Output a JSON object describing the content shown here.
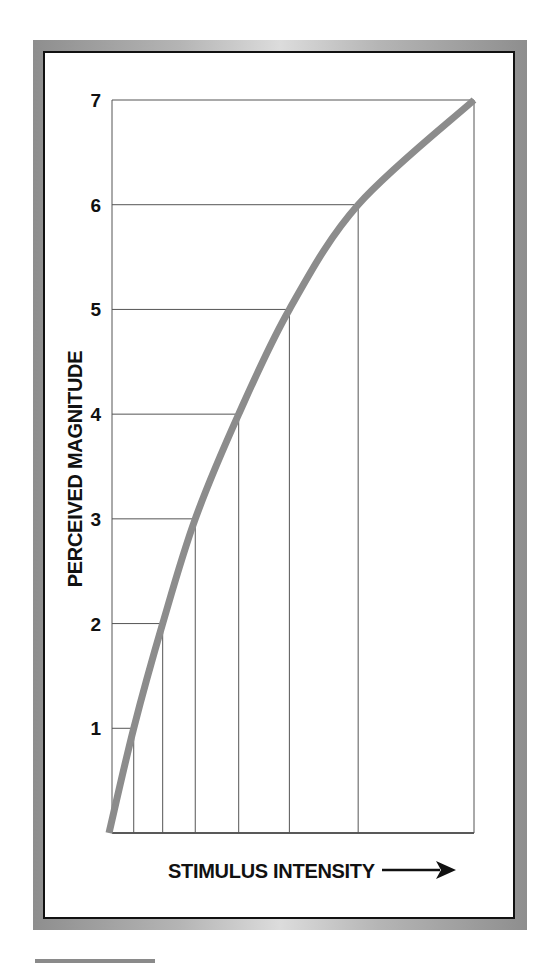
{
  "chart_data": {
    "type": "line",
    "title": "",
    "xlabel": "STIMULUS INTENSITY",
    "ylabel": "PERCEIVED MAGNITUDE",
    "x_arrow": true,
    "x_units": "relative (0-100, unlabeled axis)",
    "ylim": [
      0,
      7
    ],
    "xlim": [
      0,
      100
    ],
    "yticks": [
      "1",
      "2",
      "3",
      "4",
      "5",
      "6",
      "7"
    ],
    "grid": "drop lines from curve to axes at each integer magnitude",
    "series": [
      {
        "name": "Perceived magnitude",
        "color": "#8c8c8c",
        "x": [
          0,
          6,
          14,
          23,
          35,
          49,
          68,
          100
        ],
        "y": [
          0,
          1,
          2,
          3,
          4,
          5,
          6,
          7
        ]
      }
    ]
  },
  "colors": {
    "curve": "#8c8c8c",
    "grid": "#555555",
    "text": "#111111",
    "frame_gray": "#9a9a9a",
    "frame_border": "#111111"
  }
}
